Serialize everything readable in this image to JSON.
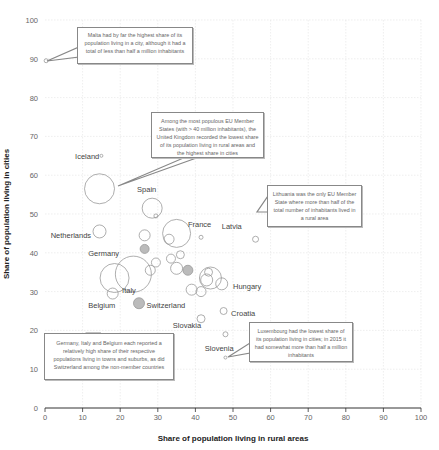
{
  "chart_data": {
    "type": "scatter",
    "subtype": "bubble",
    "title": "",
    "xlabel": "Share of population living in rural areas",
    "ylabel": "Share of population living in cities",
    "xlim": [
      0,
      100
    ],
    "ylim": [
      0,
      100
    ],
    "xticks": [
      0,
      10,
      20,
      30,
      40,
      50,
      60,
      70,
      80,
      90,
      100
    ],
    "yticks": [
      0,
      10,
      20,
      30,
      40,
      50,
      60,
      70,
      80,
      90,
      100
    ],
    "grid": true,
    "points": [
      {
        "name": "Malta",
        "x": 0.3,
        "y": 89.5,
        "r": 2,
        "fill": "#ffffff"
      },
      {
        "name": "Iceland",
        "x": 15,
        "y": 65,
        "r": 1.5,
        "fill": "#ffffff"
      },
      {
        "name": "United Kingdom",
        "x": 14.5,
        "y": 56.5,
        "r": 15,
        "fill": "#ffffff"
      },
      {
        "name": "Spain",
        "x": 28.5,
        "y": 51.5,
        "r": 10,
        "fill": "#ffffff"
      },
      {
        "name": "Cyprus",
        "x": 29.5,
        "y": 49.5,
        "r": 2,
        "fill": "#ffffff"
      },
      {
        "name": "France",
        "x": 35,
        "y": 45,
        "r": 14,
        "fill": "#ffffff"
      },
      {
        "name": "Netherlands",
        "x": 14.5,
        "y": 45.5,
        "r": 6.5,
        "fill": "#ffffff"
      },
      {
        "name": "Latvia",
        "x": 41.5,
        "y": 44,
        "r": 2,
        "fill": "#ffffff"
      },
      {
        "name": "Lithuania",
        "x": 56,
        "y": 43.5,
        "r": 3,
        "fill": "#ffffff"
      },
      {
        "name": "Sweden",
        "x": 26.5,
        "y": 44.5,
        "r": 5.5,
        "fill": "#ffffff"
      },
      {
        "name": "Denmark",
        "x": 33,
        "y": 43.5,
        "r": 5,
        "fill": "#ffffff"
      },
      {
        "name": "Norway",
        "x": 26.5,
        "y": 41,
        "r": 4.5,
        "fill": "#bbbbbb"
      },
      {
        "name": "Germany",
        "x": 23.5,
        "y": 34.5,
        "r": 18,
        "fill": "#ffffff"
      },
      {
        "name": "Italy",
        "x": 18.5,
        "y": 33.5,
        "r": 14.5,
        "fill": "#ffffff"
      },
      {
        "name": "Finland",
        "x": 33.5,
        "y": 38.5,
        "r": 4.5,
        "fill": "#ffffff"
      },
      {
        "name": "Austria",
        "x": 36,
        "y": 39.5,
        "r": 4,
        "fill": "#ffffff"
      },
      {
        "name": "Ireland",
        "x": 29.5,
        "y": 37.5,
        "r": 4.5,
        "fill": "#ffffff"
      },
      {
        "name": "Estonia",
        "x": 28,
        "y": 35.5,
        "r": 5,
        "fill": "#ffffff"
      },
      {
        "name": "Greece",
        "x": 35,
        "y": 36,
        "r": 6,
        "fill": "#ffffff"
      },
      {
        "name": "Switzerland-grey",
        "x": 38,
        "y": 35.5,
        "r": 5,
        "fill": "#bbbbbb"
      },
      {
        "name": "Poland",
        "x": 44,
        "y": 33.5,
        "r": 11,
        "fill": "#ffffff"
      },
      {
        "name": "Czech Republic",
        "x": 43,
        "y": 33,
        "r": 6,
        "fill": "#ffffff"
      },
      {
        "name": "Portugal",
        "x": 43.5,
        "y": 35,
        "r": 4,
        "fill": "#ffffff"
      },
      {
        "name": "Hungary",
        "x": 47,
        "y": 32,
        "r": 6,
        "fill": "#ffffff"
      },
      {
        "name": "Bulgaria",
        "x": 39,
        "y": 30.5,
        "r": 5.5,
        "fill": "#ffffff"
      },
      {
        "name": "Romania",
        "x": 41.5,
        "y": 30,
        "r": 5,
        "fill": "#ffffff"
      },
      {
        "name": "Belgium",
        "x": 18,
        "y": 29.5,
        "r": 5.5,
        "fill": "#ffffff"
      },
      {
        "name": "Switzerland",
        "x": 25,
        "y": 27,
        "r": 5.5,
        "fill": "#bbbbbb"
      },
      {
        "name": "Croatia",
        "x": 47.5,
        "y": 25,
        "r": 3.5,
        "fill": "#ffffff"
      },
      {
        "name": "Slovakia",
        "x": 41.5,
        "y": 23,
        "r": 4,
        "fill": "#ffffff"
      },
      {
        "name": "Slovenia",
        "x": 48,
        "y": 19,
        "r": 2.5,
        "fill": "#ffffff"
      },
      {
        "name": "Luxembourg",
        "x": 48,
        "y": 13,
        "r": 1.5,
        "fill": "#ffffff"
      }
    ],
    "labels": [
      {
        "text": "Iceland",
        "x": 8,
        "y": 65
      },
      {
        "text": "Spain",
        "x": 24.5,
        "y": 56.5
      },
      {
        "text": "France",
        "x": 38,
        "y": 47.5
      },
      {
        "text": "Latvia",
        "x": 47,
        "y": 47
      },
      {
        "text": "Netherlands",
        "x": 1.5,
        "y": 44.5
      },
      {
        "text": "Germany",
        "x": 11.5,
        "y": 40
      },
      {
        "text": "Hungary",
        "x": 50,
        "y": 31.5
      },
      {
        "text": "Italy",
        "x": 20.5,
        "y": 30.5
      },
      {
        "text": "Belgium",
        "x": 11.5,
        "y": 26.5
      },
      {
        "text": "Switzerland",
        "x": 27,
        "y": 26.5
      },
      {
        "text": "Croatia",
        "x": 49.5,
        "y": 24.5
      },
      {
        "text": "Slovakia",
        "x": 34,
        "y": 21.5
      },
      {
        "text": "Slovenia",
        "x": 42.5,
        "y": 15.5
      }
    ]
  },
  "annotations": [
    {
      "id": "malta",
      "text": "Malta had by far the highest share of its population living in a city, although it had a total of less than half a million inhabitants"
    },
    {
      "id": "uk",
      "text": "Among the most populous EU Member States (with > 40 million inhabitants), the United Kingdom recorded the lowest share of its population living in rural areas and the highest share in cities"
    },
    {
      "id": "lithuania",
      "text": "Lithuania was the only EU Member State where more than half of the total number of inhabitants lived in a rural area"
    },
    {
      "id": "germany",
      "text": "Germany, Italy and Belgium each reported a relatively high share of their respective populations living in towns and suburbs, as did Switzerland among the non-member countries"
    },
    {
      "id": "luxembourg",
      "text": "Luxembourg had the lowest share of its population living in cities; in 2015 it had somewhat more than half a million inhabitants"
    }
  ]
}
